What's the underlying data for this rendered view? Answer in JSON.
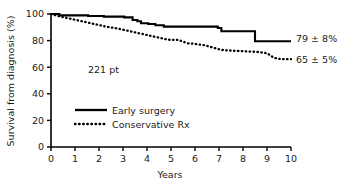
{
  "chart_data": {
    "type": "line",
    "subtype": "kaplan-meier-step",
    "title": "",
    "xlabel": "Years",
    "ylabel": "Survival from diagnosis (%)",
    "xlim": [
      0,
      10
    ],
    "ylim": [
      0,
      100
    ],
    "xticks": [
      "0",
      "1",
      "2",
      "3",
      "4",
      "5",
      "6",
      "7",
      "8",
      "9",
      "10"
    ],
    "yticks": [
      "0",
      "20",
      "40",
      "60",
      "80",
      "100"
    ],
    "grid": false,
    "legend_position": "center-left",
    "series": [
      {
        "name": "Early surgery",
        "style": "solid",
        "color": "#000000",
        "end_label": "79 ± 8%",
        "x": [
          0,
          0.35,
          0.35,
          1.55,
          1.55,
          2.2,
          2.2,
          3.05,
          3.05,
          3.4,
          3.4,
          3.6,
          3.6,
          3.75,
          3.75,
          4.05,
          4.05,
          4.35,
          4.35,
          4.7,
          4.7,
          6.95,
          6.95,
          7.1,
          7.1,
          8.5,
          8.5,
          10
        ],
        "y": [
          100,
          100,
          99,
          99,
          98.5,
          98.5,
          98,
          98,
          97.5,
          97.5,
          95.5,
          95.5,
          94.5,
          94.5,
          93,
          93,
          92.5,
          92.5,
          91.5,
          91.5,
          90.5,
          90.5,
          89.5,
          89.5,
          87,
          87,
          79.5,
          79.5
        ]
      },
      {
        "name": "Conservative Rx",
        "style": "dotted",
        "color": "#000000",
        "end_label": "65 ± 5%",
        "x": [
          0,
          0.3,
          0.8,
          1.3,
          1.8,
          2.3,
          2.8,
          3.3,
          3.8,
          4.3,
          4.8,
          5.0,
          5.3,
          5.7,
          6.0,
          6.4,
          6.8,
          7.1,
          7.5,
          8.0,
          8.6,
          9.0,
          9.3,
          9.6,
          10
        ],
        "y": [
          100,
          98.5,
          96.5,
          94.5,
          92.5,
          90.5,
          89,
          87,
          85,
          83,
          81,
          80.5,
          80.5,
          78,
          77.5,
          76.5,
          74.5,
          73,
          72.5,
          72,
          71.5,
          70.5,
          67,
          66,
          66
        ]
      }
    ],
    "annotations": [
      {
        "text": "221 pt",
        "x": 1.6,
        "y": 62
      }
    ]
  },
  "legend": {
    "items": [
      {
        "label": "Early surgery",
        "style": "solid"
      },
      {
        "label": "Conservative Rx",
        "style": "dotted"
      }
    ]
  },
  "colors": {
    "background": "#ffffff",
    "axis": "#000000",
    "text": "#1a1a1a",
    "series": "#000000"
  }
}
